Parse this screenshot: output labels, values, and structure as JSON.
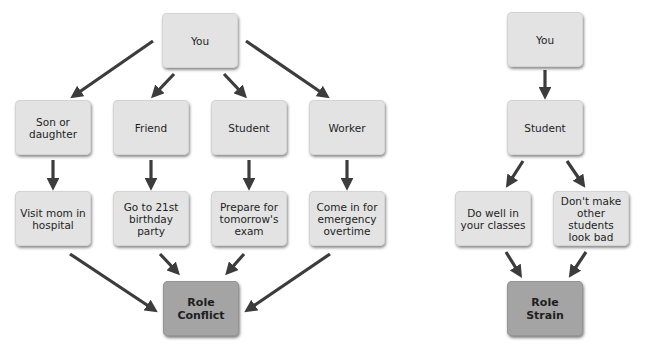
{
  "role_conflict_diagram": {
    "root": "You",
    "roles": [
      "Son or daughter",
      "Friend",
      "Student",
      "Worker"
    ],
    "demands": [
      "Visit mom in hospital",
      "Go to 21st birthday party",
      "Prepare for tomorrow's exam",
      "Come in for emergency overtime"
    ],
    "outcome": "Role Conflict"
  },
  "role_strain_diagram": {
    "root": "You",
    "role": "Student",
    "demands": [
      "Do well in your classes",
      "Don't make other students look bad"
    ],
    "outcome": "Role Strain"
  },
  "colors": {
    "box_fill": "#e3e3e3",
    "outcome_fill": "#a4a4a4",
    "arrow": "#3c3c3c",
    "text": "#1e1e1e"
  }
}
